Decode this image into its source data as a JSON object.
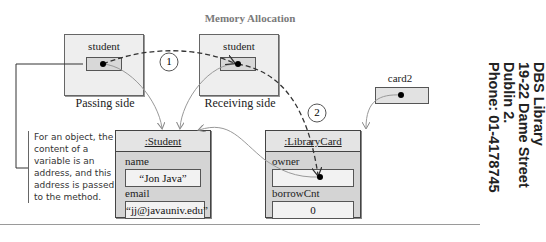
{
  "title": "Memory Allocation",
  "passing": {
    "var_name": "student",
    "side_label": "Passing side"
  },
  "receiving": {
    "var_name": "student",
    "side_label": "Receiving side"
  },
  "card2": {
    "var_name": "card2"
  },
  "steps": [
    "1",
    "2"
  ],
  "student_object": {
    "header": ":Student",
    "fields": [
      {
        "label": "name",
        "value": "“Jon Java”"
      },
      {
        "label": "email",
        "value": "“jj@javauniv.edu”"
      }
    ]
  },
  "librarycard_object": {
    "header": ":LibraryCard",
    "fields": [
      {
        "label": "owner",
        "value": ""
      },
      {
        "label": "borrowCnt",
        "value": "0"
      }
    ]
  },
  "note": "For an object, the content of a variable is an address, and this address is passed to the method.",
  "stamp": {
    "lines": [
      "DBS Library",
      "19-22 Dame Street",
      "Dublin 2.",
      "Phone: 01-4178745"
    ]
  }
}
